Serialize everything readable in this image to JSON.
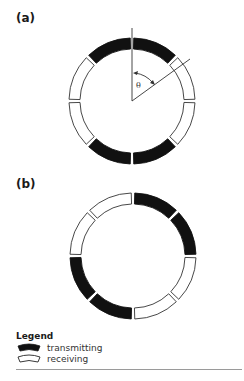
{
  "top_cutoff_text": "",
  "panels": [
    {
      "label": "(a)",
      "segments": [
        "transmitting",
        "receiving",
        "receiving",
        "transmitting",
        "transmitting",
        "receiving",
        "receiving",
        "transmitting"
      ],
      "angle_label": "θ"
    },
    {
      "label": "(b)",
      "segments": [
        "transmitting",
        "transmitting",
        "receiving",
        "receiving",
        "transmitting",
        "transmitting",
        "receiving",
        "receiving"
      ]
    }
  ],
  "legend": {
    "title": "Legend",
    "items": [
      {
        "key": "transmitting",
        "label": "transmitting"
      },
      {
        "key": "receiving",
        "label": "receiving"
      }
    ]
  },
  "colors": {
    "transmitting": "#111111",
    "receiving": "#ffffff",
    "stroke": "#333333",
    "rule": "#9a9a9a"
  }
}
